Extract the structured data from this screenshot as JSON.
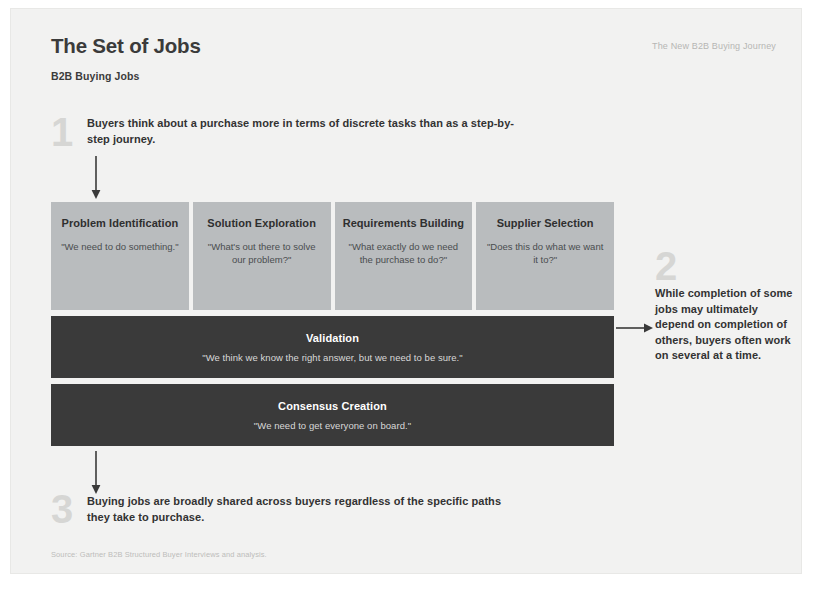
{
  "header": {
    "title": "The Set of Jobs",
    "subtitle": "B2B Buying Jobs",
    "deck_label": "The New B2B Buying Journey"
  },
  "colors": {
    "slide_background": "#f2f2f1",
    "card_background": "#b9bcbe",
    "bar_background": "#3a3a3a",
    "numeral_gray": "#d6d6d4",
    "body_text": "#333333"
  },
  "callouts": [
    {
      "number": "1",
      "text": "Buyers think about a purchase more in terms of discrete tasks than as a step-by-step journey."
    },
    {
      "number": "2",
      "text": "While completion of some jobs may ultimately depend on completion of others, buyers often work on several at a time."
    },
    {
      "number": "3",
      "text": "Buying jobs are broadly shared across buyers regardless of the specific paths they take to purchase."
    }
  ],
  "jobs": {
    "cards": [
      {
        "title": "Problem Identification",
        "quote": "\"We need to do something.\""
      },
      {
        "title": "Solution Exploration",
        "quote": "\"What's out there to solve our problem?\""
      },
      {
        "title": "Requirements Building",
        "quote": "\"What exactly do we need the purchase to do?\""
      },
      {
        "title": "Supplier Selection",
        "quote": "\"Does this do what we want it to?\""
      }
    ],
    "bars": [
      {
        "title": "Validation",
        "quote": "\"We think we know the right answer, but we need to be sure.\""
      },
      {
        "title": "Consensus Creation",
        "quote": "\"We need to get everyone on board.\""
      }
    ]
  },
  "source": "Source: Gartner B2B Structured Buyer Interviews and analysis."
}
